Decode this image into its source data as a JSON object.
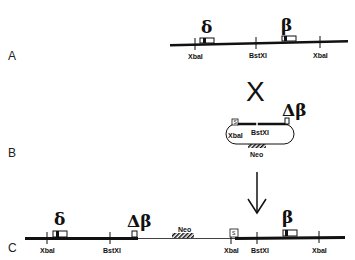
{
  "panels": {
    "A": {
      "label": "A",
      "sites": [
        "XbaI",
        "BstXI",
        "XbaI"
      ],
      "genes": [
        "δ",
        "β"
      ]
    },
    "B": {
      "label": "B",
      "cross_symbol": "X",
      "plasmid": {
        "sites": [
          "XbaI",
          "BstXI"
        ],
        "gene": "Δβ",
        "selectable_marker": "Neo",
        "box_label": "S"
      }
    },
    "C": {
      "label": "C",
      "sites": [
        "XbaI",
        "BstXI",
        "XbaI",
        "BstXI",
        "XbaI"
      ],
      "genes": [
        "δ",
        "Δβ",
        "β"
      ],
      "selectable_marker": "Neo",
      "box_label": "S"
    }
  },
  "colors": {
    "ink": "#111111",
    "background": "#ffffff"
  }
}
